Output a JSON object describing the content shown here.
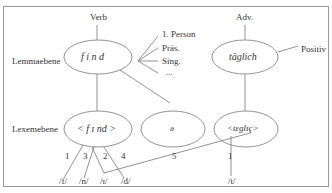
{
  "diagram": {
    "levels": {
      "lemma": "Lemmaebene",
      "lexeme": "Lexemebene"
    },
    "lemma_nodes": {
      "verb": {
        "category": "Verb",
        "lemma": "f i n d",
        "features": [
          "1. Person",
          "Präs.",
          "Sing.",
          "..."
        ]
      },
      "adverb": {
        "category": "Adv.",
        "lemma": "täglich",
        "feature": "Positiv"
      }
    },
    "lexeme_nodes": {
      "find": "< f ɪ nd >",
      "schwa": "ə",
      "taeglic": "<tɛglɪç>"
    },
    "phonemes": {
      "f": "/f/",
      "n": "/n/",
      "i": "/ɪ/",
      "d": "/d/",
      "t": "/t/"
    },
    "edge_labels": {
      "e1": "1",
      "e3": "3",
      "e2": "2",
      "e4": "4",
      "e5": "5",
      "t1": "1"
    }
  }
}
